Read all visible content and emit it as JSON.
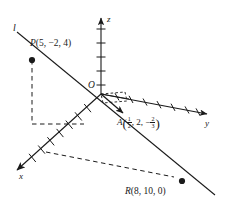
{
  "figure": {
    "type": "3d-coordinate-diagram",
    "background": "#ffffff",
    "ink_color": "#1a1a1a",
    "axes": {
      "z": {
        "label": "z",
        "direction": "up",
        "tick_count": 5,
        "arrow": true
      },
      "y": {
        "label": "y",
        "direction": "right-slightly-down",
        "tick_count": 7,
        "arrow": true
      },
      "x": {
        "label": "x",
        "direction": "down-left",
        "tick_count": 7,
        "arrow": true
      }
    },
    "origin": {
      "label": "O"
    },
    "line": {
      "label": "l",
      "description": "straight line through P, A and R"
    },
    "points": [
      {
        "name": "P",
        "label_text": "P(5, −2, 4)",
        "coords": [
          5,
          -2,
          4
        ],
        "marker": "filled-dot"
      },
      {
        "name": "A",
        "label_prefix": "A",
        "coord_x_num": "1",
        "coord_x_den": "2",
        "coord_y": "2",
        "coord_z_sign": "−",
        "coord_z_num": "2",
        "coord_z_den": "3",
        "label_text": "A(1/2, 2, −2/3)",
        "marker": "arrow-head"
      },
      {
        "name": "R",
        "label_text": "R(8, 10, 0)",
        "coords": [
          8,
          10,
          0
        ],
        "marker": "filled-dot"
      }
    ],
    "vector": {
      "from": "O",
      "to": "A",
      "style": "solid-arrow"
    },
    "dashed_guides": [
      "vertical drop from P",
      "horizontal segment from P-drop to x-axis",
      "segment from x-axis point toward R"
    ]
  }
}
